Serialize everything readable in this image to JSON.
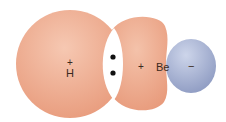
{
  "diagram": {
    "type": "orbital-overlap",
    "colors": {
      "orbital_sp": "#eba587",
      "orbital_sp_highlight": "#f5c4ad",
      "orbital_p": "#9aa6c9",
      "orbital_p_highlight": "#c6cfe6",
      "overlap_region": "#ffffff",
      "electron_dot": "#111111"
    },
    "labels": {
      "h_plus": "+",
      "h_atom": "H",
      "be_plus": "+",
      "be_atom": "Be",
      "minus": "−"
    },
    "electrons": 2
  }
}
